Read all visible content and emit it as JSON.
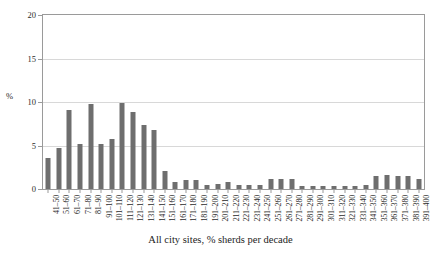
{
  "chart_data": {
    "type": "bar",
    "title": "",
    "xlabel": "All city sites, % sherds per decade",
    "ylabel": "%",
    "ylim": [
      0,
      20
    ],
    "yticks": [
      0,
      5,
      10,
      15,
      20
    ],
    "grid": true,
    "legend": false,
    "bar_color": "#6e6e6e",
    "categories": [
      "41–50",
      "51–60",
      "61–70",
      "71–80",
      "81–90",
      "91–100",
      "101–110",
      "111–120",
      "121–130",
      "131–140",
      "141–150",
      "151–160",
      "161–170",
      "171–180",
      "181–190",
      "191–200",
      "201–210",
      "211–220",
      "221–230",
      "231–240",
      "241–250",
      "251–260",
      "261–270",
      "271–280",
      "281–290",
      "291–300",
      "301–310",
      "311–320",
      "321–330",
      "331–340",
      "341–350",
      "351–360",
      "361–370",
      "371–380",
      "381–390",
      "391–400"
    ],
    "values": [
      3.6,
      4.7,
      9.1,
      5.2,
      9.8,
      5.2,
      5.8,
      9.9,
      8.8,
      7.4,
      6.8,
      2.1,
      0.8,
      1.0,
      1.0,
      0.5,
      0.6,
      0.8,
      0.5,
      0.5,
      0.5,
      1.2,
      1.2,
      1.2,
      0.4,
      0.4,
      0.4,
      0.4,
      0.4,
      0.4,
      0.5,
      1.5,
      1.6,
      1.5,
      1.5,
      1.1
    ]
  }
}
